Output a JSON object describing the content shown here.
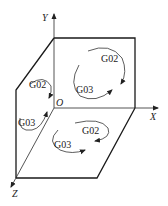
{
  "diagram": {
    "axes": {
      "x_label": "X",
      "y_label": "Y",
      "z_label": "Z",
      "origin_label": "O"
    },
    "planes": [
      {
        "name": "XY",
        "labels": [
          "G02",
          "G03"
        ]
      },
      {
        "name": "ZX",
        "labels": [
          "G02",
          "G03"
        ]
      },
      {
        "name": "YZ",
        "labels": [
          "G02",
          "G03"
        ]
      }
    ],
    "colors": {
      "line": "#1a1a1a",
      "background": "#ffffff"
    }
  }
}
